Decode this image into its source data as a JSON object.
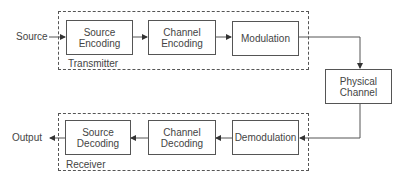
{
  "diagram": {
    "input_label": "Source",
    "output_label": "Output",
    "groups": {
      "transmitter": {
        "label": "Transmitter"
      },
      "receiver": {
        "label": "Receiver"
      }
    },
    "blocks": {
      "source_encoding": {
        "line1": "Source",
        "line2": "Encoding"
      },
      "channel_encoding": {
        "line1": "Channel",
        "line2": "Encoding"
      },
      "modulation": {
        "line1": "Modulation"
      },
      "physical_channel": {
        "line1": "Physical",
        "line2": "Channel"
      },
      "demodulation": {
        "line1": "Demodulation"
      },
      "channel_decoding": {
        "line1": "Channel",
        "line2": "Decoding"
      },
      "source_decoding": {
        "line1": "Source",
        "line2": "Decoding"
      }
    },
    "flow": [
      "Source",
      "Source Encoding",
      "Channel Encoding",
      "Modulation",
      "Physical Channel",
      "Demodulation",
      "Channel Decoding",
      "Source Decoding",
      "Output"
    ],
    "colors": {
      "line": "#555555",
      "text": "#444444",
      "background": "#ffffff"
    }
  }
}
